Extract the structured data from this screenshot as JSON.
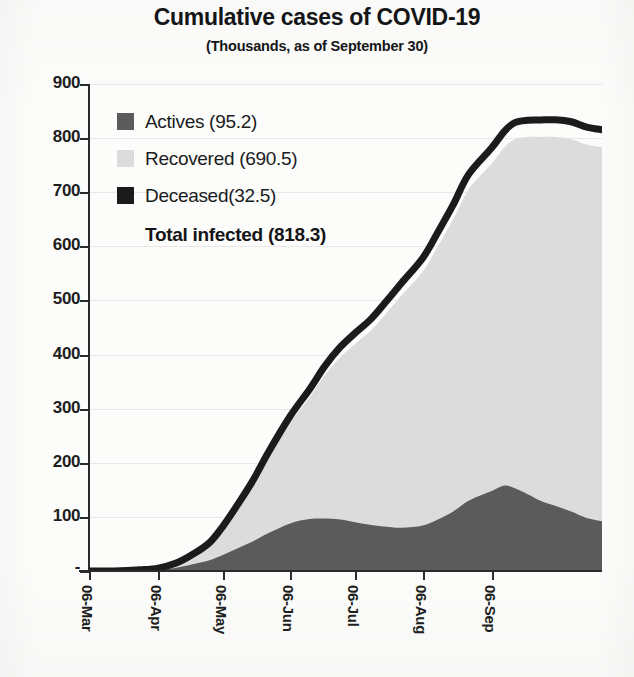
{
  "title": "Cumulative cases of COVID-19",
  "subtitle": "(Thousands, as of September 30)",
  "legend": {
    "items": [
      {
        "label": "Actives (95.2)",
        "color": "#5b5b5b",
        "swatch_name": "legend-swatch-actives"
      },
      {
        "label": "Recovered (690.5)",
        "color": "#dcdcdc",
        "swatch_name": "legend-swatch-recovered"
      },
      {
        "label": "Deceased(32.5)",
        "color": "#1b1b1b",
        "swatch_name": "legend-swatch-deceased"
      }
    ],
    "total_label": "Total infected (818.3)"
  },
  "axes": {
    "y_ticks": [
      "900",
      "800",
      "700",
      "600",
      "500",
      "400",
      "300",
      "200",
      "100",
      "-"
    ],
    "x_ticks": [
      "06-Mar",
      "06-Apr",
      "06-May",
      "06-Jun",
      "06-Jul",
      "06-Aug",
      "06-Sep"
    ]
  },
  "chart_data": {
    "type": "area",
    "stacked": true,
    "title": "Cumulative cases of COVID-19",
    "subtitle": "(Thousands, as of September 30)",
    "xlabel": "",
    "ylabel": "",
    "units": "Thousands",
    "as_of": "September 30",
    "ylim": [
      0,
      900
    ],
    "ytick_values": [
      0,
      100,
      200,
      300,
      400,
      500,
      600,
      700,
      800,
      900
    ],
    "ytick_labels": [
      "-",
      "100",
      "200",
      "300",
      "400",
      "500",
      "600",
      "700",
      "800",
      "900"
    ],
    "grid": "horizontal-faint",
    "legend_position": "inside-top-left",
    "x_tick_labels": [
      "06-Mar",
      "06-Apr",
      "06-May",
      "06-Jun",
      "06-Jul",
      "06-Aug",
      "06-Sep"
    ],
    "x_tick_fractions": [
      0.0,
      0.135,
      0.262,
      0.392,
      0.519,
      0.651,
      0.785
    ],
    "totals": {
      "actives": 95.2,
      "recovered": 690.5,
      "deceased": 32.5,
      "total_infected": 818.3
    },
    "series": [
      {
        "name": "Actives",
        "color": "#5b5b5b",
        "stack_order": 1,
        "x": [
          0.0,
          0.05,
          0.1,
          0.135,
          0.17,
          0.2,
          0.235,
          0.262,
          0.29,
          0.32,
          0.35,
          0.392,
          0.43,
          0.46,
          0.49,
          0.519,
          0.55,
          0.58,
          0.61,
          0.651,
          0.68,
          0.71,
          0.74,
          0.785,
          0.81,
          0.83,
          0.855,
          0.88,
          0.91,
          0.94,
          0.97,
          1.0
        ],
        "values": [
          0,
          0,
          1,
          2,
          6,
          12,
          20,
          30,
          42,
          55,
          70,
          88,
          96,
          97,
          95,
          90,
          85,
          82,
          80,
          84,
          95,
          110,
          130,
          148,
          158,
          153,
          142,
          130,
          120,
          110,
          98,
          92
        ]
      },
      {
        "name": "Recovered",
        "color": "#dcdcdc",
        "stack_order": 2,
        "x": [
          0.0,
          0.05,
          0.1,
          0.135,
          0.17,
          0.2,
          0.235,
          0.262,
          0.29,
          0.32,
          0.35,
          0.392,
          0.43,
          0.46,
          0.49,
          0.519,
          0.55,
          0.58,
          0.61,
          0.651,
          0.68,
          0.71,
          0.74,
          0.785,
          0.81,
          0.83,
          0.855,
          0.88,
          0.91,
          0.94,
          0.97,
          1.0
        ],
        "values": [
          0,
          0,
          1,
          3,
          8,
          16,
          30,
          50,
          75,
          105,
          140,
          185,
          225,
          265,
          300,
          330,
          360,
          395,
          430,
          470,
          505,
          540,
          575,
          605,
          625,
          645,
          660,
          672,
          682,
          688,
          690,
          691
        ]
      },
      {
        "name": "Deceased",
        "color": "#1b1b1b",
        "stack_order": 3,
        "x": [
          0.0,
          0.05,
          0.1,
          0.135,
          0.17,
          0.2,
          0.235,
          0.262,
          0.29,
          0.32,
          0.35,
          0.392,
          0.43,
          0.46,
          0.49,
          0.519,
          0.55,
          0.58,
          0.61,
          0.651,
          0.68,
          0.71,
          0.74,
          0.785,
          0.81,
          0.83,
          0.855,
          0.88,
          0.91,
          0.94,
          0.97,
          1.0
        ],
        "values": [
          0,
          0,
          0.2,
          0.4,
          0.8,
          1.5,
          2.5,
          4,
          6,
          8,
          10,
          13,
          15,
          17,
          19,
          20,
          21,
          22,
          23,
          25,
          26,
          27,
          28,
          29,
          30,
          30.5,
          31,
          31.5,
          32,
          32.2,
          32.4,
          32.5
        ]
      }
    ],
    "total_curve": {
      "name": "Total infected",
      "x": [
        0.0,
        0.05,
        0.1,
        0.135,
        0.17,
        0.2,
        0.235,
        0.262,
        0.29,
        0.32,
        0.35,
        0.392,
        0.43,
        0.46,
        0.49,
        0.519,
        0.55,
        0.58,
        0.61,
        0.651,
        0.68,
        0.71,
        0.74,
        0.785,
        0.81,
        0.83,
        0.855,
        0.88,
        0.91,
        0.94,
        0.97,
        1.0
      ],
      "values": [
        0,
        0,
        2.2,
        5.4,
        14.8,
        29.5,
        52.5,
        84,
        123,
        168,
        220,
        286,
        336,
        379,
        414,
        440,
        466,
        499,
        533,
        579,
        626,
        677,
        733,
        782,
        813,
        828.5,
        833,
        833.5,
        834,
        830.2,
        820.4,
        815.5
      ]
    }
  }
}
